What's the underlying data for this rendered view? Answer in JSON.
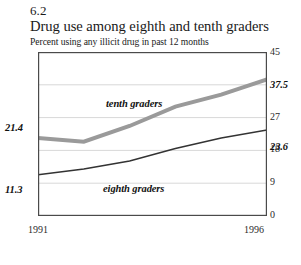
{
  "figure": {
    "number": "6.2",
    "title": "Drug use among eighth and tenth graders",
    "subtitle": "Percent using any illicit drug in past 12 months"
  },
  "chart_data": {
    "type": "line",
    "title": "Drug use among eighth and tenth graders",
    "subtitle": "Percent using any illicit drug in past 12 months",
    "xlabel": "",
    "ylabel": "",
    "x": [
      1991,
      1992,
      1993,
      1994,
      1995,
      1996
    ],
    "xlim": [
      1991,
      1996
    ],
    "ylim": [
      0,
      45
    ],
    "yticks": [
      "0",
      "9",
      "18",
      "27",
      "45"
    ],
    "ytick_values": [
      0,
      9,
      18,
      27,
      45
    ],
    "gridlines": [
      9,
      18,
      27,
      36
    ],
    "grid": true,
    "legend": "inline-labels",
    "xtick_labels": [
      "1991",
      "1996"
    ],
    "series": [
      {
        "name": "tenth graders",
        "color": "#9a9a9a",
        "width": 4,
        "values": [
          21.4,
          20.4,
          24.7,
          30.0,
          33.3,
          37.5
        ],
        "start_label": "21.4",
        "end_label": "37.5"
      },
      {
        "name": "eighth graders",
        "color": "#333333",
        "width": 1.6,
        "values": [
          11.3,
          12.9,
          15.1,
          18.5,
          21.4,
          23.6
        ],
        "start_label": "11.3",
        "end_label": "23.6"
      }
    ],
    "annotations": [
      {
        "text": "tenth graders",
        "x": 1993.05,
        "y": 31.5
      },
      {
        "text": "eighth graders",
        "x": 1993.05,
        "y": 12.2
      }
    ]
  },
  "axis": {
    "y_labels": [
      {
        "text": "45",
        "top": 47
      },
      {
        "text": "27",
        "top": 112
      },
      {
        "text": "18",
        "top": 144
      },
      {
        "text": "9",
        "top": 177
      },
      {
        "text": "0",
        "top": 210
      }
    ],
    "x_labels": [
      {
        "text": "1991",
        "left": 28
      },
      {
        "text": "1996",
        "left": 244
      }
    ]
  },
  "labels": {
    "tenth_start": "21.4",
    "tenth_end": "37.5",
    "eighth_start": "11.3",
    "eighth_end": "23.6",
    "tenth_series": "tenth graders",
    "eighth_series": "eighth graders"
  },
  "colors": {
    "tenth_line": "#9a9a9a",
    "eighth_line": "#333333",
    "frame": "#4a4a4a",
    "grid": "#d8d8d8",
    "text": "#1a1a1a"
  }
}
